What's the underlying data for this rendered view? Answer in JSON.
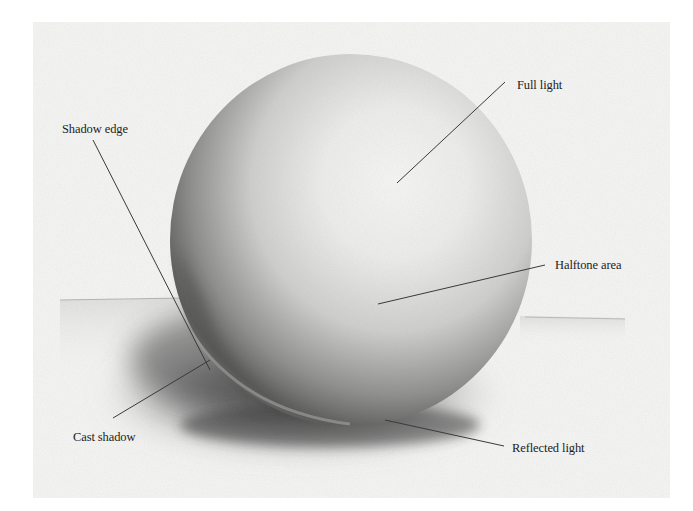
{
  "figure": {
    "labels": {
      "full_light": "Full light",
      "shadow_edge": "Shadow edge",
      "halftone_area": "Halftone area",
      "cast_shadow": "Cast shadow",
      "reflected_light": "Reflected light"
    },
    "colors": {
      "paper": "#f6f6f5",
      "leader_line": "#3a3a3a",
      "label_text": "#1c1c1c",
      "shadow_dark": "#2e2e2e"
    }
  }
}
